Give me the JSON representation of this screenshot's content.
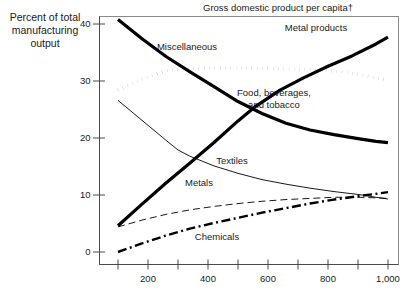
{
  "chart_data": {
    "type": "line",
    "title": "Gross domestic product per capita†",
    "xlabel": "",
    "ylabel": "Percent of total manufacturing output",
    "ylabel_lines": [
      "Percent of total",
      "manufacturing",
      "output"
    ],
    "xlim": [
      0,
      1050
    ],
    "ylim": [
      0,
      42
    ],
    "grid": false,
    "legend_position": "inline-annotations",
    "xticks": [
      200,
      400,
      600,
      800,
      1000
    ],
    "xtick_labels": [
      "200",
      "400",
      "600",
      "800",
      "1,000"
    ],
    "xminor_ticks": [
      100,
      300,
      500,
      700,
      900
    ],
    "yticks": [
      0,
      10,
      20,
      30,
      40
    ],
    "ytick_labels": [
      "0",
      "10",
      "20",
      "30",
      "40"
    ],
    "series": [
      {
        "name": "Metal products",
        "style": "solid-thick",
        "label": "Metal products",
        "label_x": 760,
        "label_y": 38.8,
        "x": [
          100,
          180,
          260,
          340,
          420,
          500,
          560,
          640,
          720,
          800,
          880,
          960,
          1000
        ],
        "values": [
          4.6,
          8.4,
          12.1,
          15.6,
          19.2,
          23.0,
          25.6,
          28.4,
          30.6,
          32.6,
          34.4,
          36.5,
          37.7
        ]
      },
      {
        "name": "Miscellaneous",
        "style": "dotted-thick",
        "label": "Miscellaneous",
        "label_x": 330,
        "label_y": 35.4,
        "x": [
          100,
          180,
          260,
          340,
          420,
          500,
          580,
          660,
          740,
          820,
          900,
          960,
          1000
        ],
        "values": [
          28.4,
          30.3,
          31.8,
          32.2,
          32.3,
          32.3,
          32.2,
          32.1,
          32.0,
          31.7,
          31.2,
          30.6,
          30.2
        ]
      },
      {
        "name": "Food, beverages, and tobacco",
        "style": "solid-thick",
        "label_lines": [
          "Food, beverages,",
          "and tobacco"
        ],
        "label_x": 620,
        "label_y": 27.4,
        "x": [
          100,
          180,
          260,
          340,
          420,
          500,
          580,
          660,
          740,
          820,
          900,
          960,
          1000
        ],
        "values": [
          40.8,
          37.4,
          34.3,
          31.6,
          29.0,
          26.4,
          24.3,
          22.6,
          21.4,
          20.6,
          19.9,
          19.4,
          19.2
        ]
      },
      {
        "name": "Textiles",
        "style": "solid-thin",
        "label": "Textiles",
        "label_x": 480,
        "label_y": 15.4,
        "x": [
          100,
          180,
          260,
          300,
          340,
          420,
          500,
          580,
          660,
          740,
          820,
          900,
          960,
          1000
        ],
        "values": [
          26.6,
          23.1,
          19.6,
          17.9,
          16.8,
          15.1,
          13.8,
          12.7,
          11.9,
          11.2,
          10.6,
          10.1,
          9.6,
          9.3
        ]
      },
      {
        "name": "Metals",
        "style": "dashed-thin",
        "label": "Metals",
        "label_x": 370,
        "label_y": 11.6,
        "x": [
          100,
          180,
          260,
          340,
          420,
          500,
          580,
          660,
          740,
          820,
          900,
          960,
          1000
        ],
        "values": [
          4.4,
          5.6,
          6.6,
          7.4,
          8.0,
          8.5,
          8.9,
          9.2,
          9.4,
          9.6,
          9.6,
          9.5,
          9.4
        ]
      },
      {
        "name": "Chemicals",
        "style": "dashdot-thick",
        "label": "Chemicals",
        "label_x": 430,
        "label_y": 2.1,
        "x": [
          100,
          180,
          260,
          340,
          420,
          500,
          580,
          660,
          740,
          820,
          900,
          960,
          1000
        ],
        "values": [
          0.0,
          1.5,
          2.9,
          4.1,
          5.1,
          6.0,
          6.9,
          7.7,
          8.5,
          9.2,
          9.8,
          10.2,
          10.5
        ]
      }
    ]
  },
  "colors": {
    "ink": "#000000",
    "frame": "#8a8a8a",
    "axis": "#4a4a4a",
    "background": "#ffffff"
  }
}
